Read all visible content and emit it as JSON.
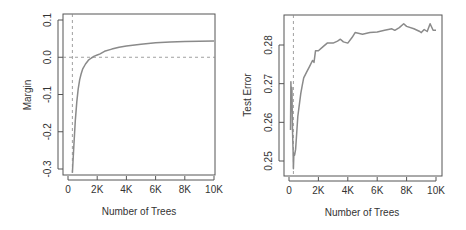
{
  "chart_data": [
    {
      "type": "line",
      "title": "",
      "xlabel": "Number of Trees",
      "ylabel": "Margin",
      "xlim": [
        0,
        10000
      ],
      "ylim": [
        -0.3,
        0.1
      ],
      "xticks": [
        0,
        2000,
        4000,
        6000,
        8000,
        10000
      ],
      "xtick_labels": [
        "0",
        "2K",
        "4K",
        "6K",
        "8K",
        "10K"
      ],
      "yticks": [
        -0.3,
        -0.2,
        -0.1,
        0.0,
        0.1
      ],
      "ytick_labels": [
        "-0.3",
        "-0.2",
        "-0.1",
        "0.0",
        "0.1"
      ],
      "grid": false,
      "reference_lines": {
        "vertical_x": 300,
        "horizontal_y": 0.0
      },
      "series": [
        {
          "name": "Margin",
          "color": "#8a8a8a",
          "x": [
            300,
            400,
            500,
            600,
            700,
            800,
            900,
            1000,
            1200,
            1400,
            1600,
            1800,
            2000,
            2200,
            2500,
            3000,
            3500,
            4000,
            5000,
            6000,
            7000,
            8000,
            9000,
            10000
          ],
          "y": [
            -0.31,
            -0.24,
            -0.17,
            -0.12,
            -0.085,
            -0.06,
            -0.045,
            -0.032,
            -0.018,
            -0.008,
            -0.002,
            0.003,
            0.006,
            0.009,
            0.016,
            0.022,
            0.027,
            0.03,
            0.035,
            0.039,
            0.041,
            0.042,
            0.043,
            0.044
          ]
        }
      ]
    },
    {
      "type": "line",
      "title": "",
      "xlabel": "Number of Trees",
      "ylabel": "Test Error",
      "xlim": [
        0,
        10000
      ],
      "ylim": [
        0.2465,
        0.2865
      ],
      "xticks": [
        0,
        2000,
        4000,
        6000,
        8000,
        10000
      ],
      "xtick_labels": [
        "0",
        "2K",
        "4K",
        "6K",
        "8K",
        "10K"
      ],
      "yticks": [
        0.25,
        0.26,
        0.27,
        0.28
      ],
      "ytick_labels": [
        "0.25",
        "0.26",
        "0.27",
        "0.28"
      ],
      "grid": false,
      "reference_lines": {
        "vertical_x": 300
      },
      "series": [
        {
          "name": "Test Error",
          "color": "#8a8a8a",
          "x": [
            100,
            130,
            160,
            200,
            240,
            280,
            300,
            330,
            380,
            450,
            500,
            600,
            700,
            800,
            900,
            1000,
            1200,
            1400,
            1600,
            1700,
            1800,
            2000,
            2300,
            2600,
            3000,
            3300,
            3500,
            3700,
            4000,
            4300,
            4500,
            5000,
            5500,
            6000,
            6500,
            7000,
            7200,
            7500,
            7800,
            8000,
            8500,
            8900,
            9000,
            9200,
            9400,
            9600,
            9800,
            10000
          ],
          "y": [
            0.258,
            0.2705,
            0.263,
            0.269,
            0.258,
            0.2525,
            0.248,
            0.252,
            0.2515,
            0.253,
            0.256,
            0.2615,
            0.2645,
            0.2675,
            0.2695,
            0.2715,
            0.273,
            0.2745,
            0.276,
            0.2755,
            0.2785,
            0.2785,
            0.2795,
            0.2805,
            0.2805,
            0.281,
            0.2815,
            0.2808,
            0.2805,
            0.282,
            0.2832,
            0.2828,
            0.2832,
            0.2834,
            0.2838,
            0.2842,
            0.2838,
            0.2845,
            0.2855,
            0.2848,
            0.2842,
            0.2835,
            0.2832,
            0.284,
            0.2835,
            0.2855,
            0.2838,
            0.2838
          ]
        }
      ]
    }
  ]
}
